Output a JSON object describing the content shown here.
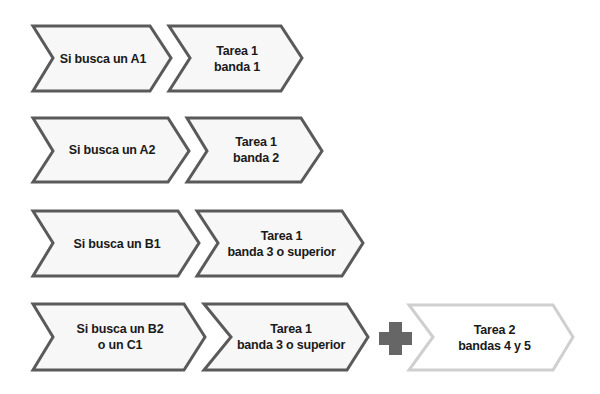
{
  "colors": {
    "stroke_dark": "#5a5a5a",
    "stroke_light": "#cfcfcf",
    "fill": "#f7f7f7",
    "plus": "#666666",
    "text": "#1a1a1a"
  },
  "rows": [
    {
      "level": {
        "label": "Si busca un A1"
      },
      "task": {
        "label": "Tarea 1\nbanda 1"
      }
    },
    {
      "level": {
        "label": "Si busca un A2"
      },
      "task": {
        "label": "Tarea 1\nbanda 2"
      }
    },
    {
      "level": {
        "label": "Si busca un B1"
      },
      "task": {
        "label": "Tarea 1\nbanda 3 o superior"
      }
    },
    {
      "level": {
        "label": "Si busca un B2\no un C1"
      },
      "task": {
        "label": "Tarea 1\nbanda 3 o superior"
      },
      "connector": {
        "icon": "plus-icon"
      },
      "extra_task": {
        "label": "Tarea 2\nbandas 4 y 5"
      }
    }
  ]
}
